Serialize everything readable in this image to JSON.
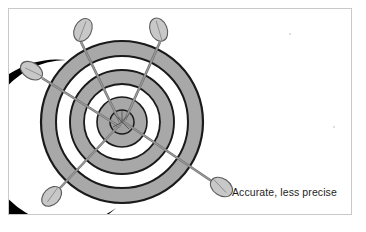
{
  "figure": {
    "caption": "Accurate, less precise",
    "alt_title": "Dartboard target with five darts clustered at the bullseye",
    "frame": {
      "x": 8,
      "y": 8,
      "width": 344,
      "height": 207,
      "border_color": "#c9c9c9",
      "background": "#ffffff"
    }
  },
  "target": {
    "center_x": 114,
    "center_y": 114,
    "ring_fill": "#a8a8a8",
    "ring_gap_fill": "#ffffff",
    "outline_color": "#1a1a1a",
    "shadow_color": "#000000",
    "bullseye_fill": "#a8a8a8",
    "rings": [
      {
        "name": "ring-outer-band",
        "outer_radius": 81,
        "inner_radius": 66,
        "fill": "#a8a8a8"
      },
      {
        "name": "ring-gap-1",
        "outer_radius": 66,
        "inner_radius": 52,
        "fill": "#ffffff"
      },
      {
        "name": "ring-middle-band",
        "outer_radius": 52,
        "inner_radius": 38,
        "fill": "#a8a8a8"
      },
      {
        "name": "ring-gap-2",
        "outer_radius": 38,
        "inner_radius": 25,
        "fill": "#ffffff"
      },
      {
        "name": "ring-inner-band",
        "outer_radius": 25,
        "inner_radius": 12,
        "fill": "#a8a8a8"
      },
      {
        "name": "bullseye",
        "outer_radius": 12,
        "inner_radius": 0,
        "fill": "#a8a8a8"
      }
    ]
  },
  "darts": [
    {
      "id": "dart-upper-left",
      "label": "Dart 1",
      "tip_x": 112,
      "tip_y": 112,
      "tail_x": 71,
      "tail_y": 30,
      "fletch_angle": 26,
      "shaft_color": "#8a8a8a",
      "fletch_fill": "#c4c4c4"
    },
    {
      "id": "dart-upper-right",
      "label": "Dart 2",
      "tip_x": 116,
      "tip_y": 110,
      "tail_x": 154,
      "tail_y": 30,
      "fletch_angle": -26,
      "shaft_color": "#8a8a8a",
      "fletch_fill": "#c4c4c4"
    },
    {
      "id": "dart-left",
      "label": "Dart 3",
      "tip_x": 110,
      "tip_y": 118,
      "tail_x": 30,
      "tail_y": 68,
      "fletch_angle": 58,
      "shaft_color": "#8a8a8a",
      "fletch_fill": "#c4c4c4"
    },
    {
      "id": "dart-lower-left",
      "label": "Dart 4",
      "tip_x": 118,
      "tip_y": 110,
      "tail_x": 50,
      "tail_y": 178,
      "fletch_angle": -45,
      "shaft_color": "#8a8a8a",
      "fletch_fill": "#c4c4c4"
    },
    {
      "id": "dart-lower-right",
      "label": "Dart 5",
      "tip_x": 110,
      "tip_y": 110,
      "tail_x": 206,
      "tail_y": 174,
      "fletch_angle": 34,
      "shaft_color": "#8a8a8a",
      "fletch_fill": "#c4c4c4"
    }
  ]
}
